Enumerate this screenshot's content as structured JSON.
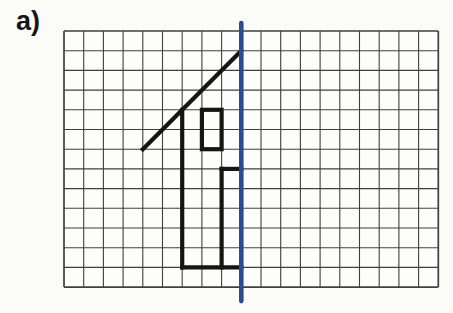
{
  "figure": {
    "label": "a)"
  },
  "diagram": {
    "background": "#fdfdfb",
    "grid": {
      "cols": 19,
      "rows": 13,
      "cell": 19.7,
      "left": 64,
      "top": 31,
      "line_color": "#3f3f3f",
      "line_width": 1.1,
      "border_width": 1.7
    },
    "mirror_line": {
      "col": 9,
      "color": "#2e4a94",
      "width": 4.6,
      "overhang_top": 8,
      "overhang_bottom": 14
    },
    "shape": {
      "color": "#151515",
      "stroke_width": 4.2,
      "segments": [
        {
          "name": "roof-diagonal",
          "from": [
            4,
            6
          ],
          "to": [
            9,
            1
          ]
        },
        {
          "name": "left-wall",
          "from": [
            6,
            4
          ],
          "to": [
            6,
            12
          ]
        },
        {
          "name": "floor",
          "from": [
            6,
            12
          ],
          "to": [
            9,
            12
          ]
        },
        {
          "name": "door-side",
          "from": [
            8,
            7
          ],
          "to": [
            8,
            12
          ]
        },
        {
          "name": "door-top",
          "from": [
            8,
            7
          ],
          "to": [
            9,
            7
          ]
        }
      ],
      "rects": [
        {
          "name": "window",
          "at": [
            7,
            4
          ],
          "cols": 1,
          "rows": 2
        }
      ]
    }
  }
}
